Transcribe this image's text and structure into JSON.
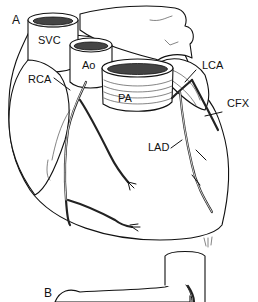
{
  "figure": {
    "panels": [
      {
        "id": "A",
        "label": "A"
      },
      {
        "id": "B",
        "label": "B"
      }
    ],
    "structures": {
      "svc": "SVC",
      "ao": "Ao",
      "pa": "PA",
      "rca": "RCA",
      "lca": "LCA",
      "cfx": "CFX",
      "lad": "LAD"
    },
    "colors": {
      "line": "#111111",
      "background": "#ffffff"
    }
  }
}
